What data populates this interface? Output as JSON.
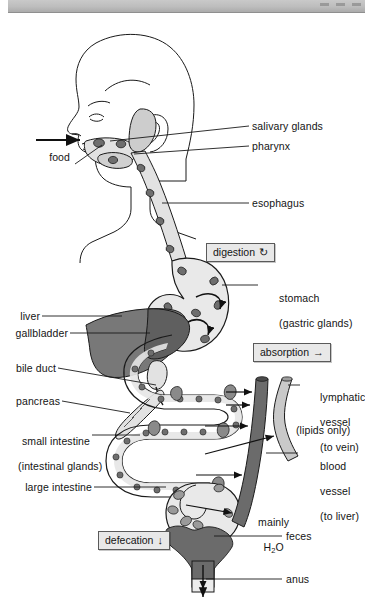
{
  "window": {
    "controls": [
      "minimize-button",
      "maximize-button",
      "close-button"
    ]
  },
  "diagram": {
    "colors": {
      "outline": "#1a1a1a",
      "tract_fill": "#e2e2e2",
      "tract_fill_light": "#ececec",
      "gland_spot": "#6e6e6e",
      "liver_dark": "#5f5f5f",
      "liver_mid": "#787878",
      "blood_vessel": "#6b6b6b",
      "lymph_vessel": "#c9c9c9",
      "feces": "#6b6b6b",
      "box_fill": "#e8e8e8",
      "box_border": "#5a5a5a"
    },
    "labels": {
      "food": "food",
      "salivary_glands": "salivary glands",
      "pharynx": "pharynx",
      "esophagus": "esophagus",
      "stomach_line1": "stomach",
      "stomach_line2": "(gastric glands)",
      "liver": "liver",
      "gallbladder": "gallbladder",
      "bile_duct": "bile duct",
      "pancreas": "pancreas",
      "small_intestine_line1": "small intestine",
      "small_intestine_line2": "(intestinal glands)",
      "large_intestine": "large intestine",
      "lymphatic_line1": "lymphatic",
      "lymphatic_line2": "vessel",
      "lymphatic_line3": "(to vein)",
      "lipids_only": "(lipids only)",
      "blood_line1": "blood",
      "blood_line2": "vessel",
      "blood_line3": "(to liver)",
      "mainly_line1": "mainly",
      "mainly_line2_prefix": "H",
      "mainly_line2_sub": "2",
      "mainly_line2_suffix": "O",
      "feces": "feces",
      "anus": "anus"
    },
    "process_boxes": [
      {
        "id": "digestion",
        "label": "digestion",
        "glyph": "↻",
        "glyph_name": "circular-arrow-icon"
      },
      {
        "id": "absorption",
        "label": "absorption",
        "glyph": "→",
        "glyph_name": "arrow-right-icon"
      },
      {
        "id": "defecation",
        "label": "defecation",
        "glyph": "↓",
        "glyph_name": "arrow-down-icon"
      }
    ]
  }
}
